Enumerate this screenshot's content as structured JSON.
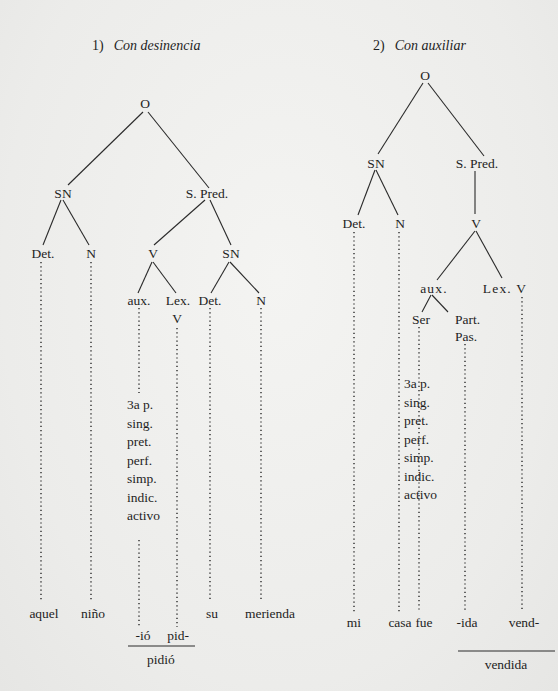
{
  "diagram": {
    "tree1": {
      "number": "1)",
      "title": "Con desinencia",
      "nodes": {
        "root": "O",
        "sn": "SN",
        "spred": "S. Pred.",
        "det": "Det.",
        "n": "N",
        "v": "V",
        "sn2": "SN",
        "aux": "aux.",
        "lex": "Lex.",
        "lex_v": "V",
        "det2": "Det.",
        "n2": "N"
      },
      "features": [
        "3a p.",
        "sing.",
        "pret.",
        "perf.",
        "simp.",
        "indic.",
        "activo"
      ],
      "terminals": {
        "det": "aquel",
        "n": "niño",
        "det2": "su",
        "n2": "merienda",
        "suffix": "-ió",
        "stem": "pid-",
        "combined": "pidió"
      }
    },
    "tree2": {
      "number": "2)",
      "title": "Con auxiliar",
      "nodes": {
        "root": "O",
        "sn": "SN",
        "spred": "S. Pred.",
        "det": "Det.",
        "n": "N",
        "v": "V",
        "aux": "aux.",
        "lex_v": "Lex. V",
        "ser": "Ser",
        "part": "Part.",
        "pas": "Pas."
      },
      "features": [
        "3a p.",
        "sing.",
        "pret.",
        "perf.",
        "simp.",
        "indic.",
        "activo"
      ],
      "terminals": {
        "det": "mi",
        "n": "casa",
        "ser": "fue",
        "suffix": "-ida",
        "stem": "vend-",
        "combined": "vendida"
      }
    },
    "colors": {
      "ink": "#1e1e1e",
      "paper": "#efefed"
    }
  }
}
